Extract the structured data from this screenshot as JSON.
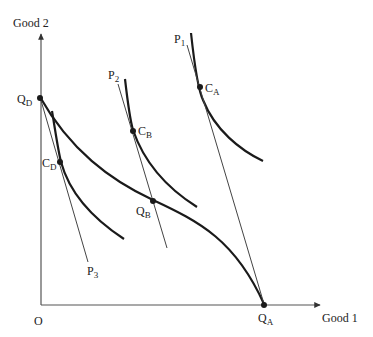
{
  "diagram": {
    "axes": {
      "y_label": "Good 2",
      "x_label": "Good 1",
      "origin_label": "O"
    },
    "price_lines": [
      {
        "id": "P1",
        "label": "P",
        "sub": "1"
      },
      {
        "id": "P2",
        "label": "P",
        "sub": "2"
      },
      {
        "id": "P3",
        "label": "P",
        "sub": "3"
      }
    ],
    "points": [
      {
        "id": "CA",
        "label": "C",
        "sub": "A"
      },
      {
        "id": "CB",
        "label": "C",
        "sub": "B"
      },
      {
        "id": "CD",
        "label": "C",
        "sub": "D"
      },
      {
        "id": "QB",
        "label": "Q",
        "sub": "B"
      },
      {
        "id": "QD",
        "label": "Q",
        "sub": "D"
      },
      {
        "id": "QA",
        "label": "Q",
        "sub": "A"
      }
    ],
    "colors": {
      "curve": "#1a1a1a",
      "line": "#444444",
      "axis": "#555555"
    }
  }
}
